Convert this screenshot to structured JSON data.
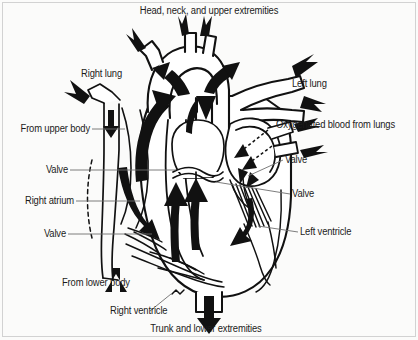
{
  "figure": {
    "background_color": "#fbfbfa",
    "ink_color": "#111111",
    "leader_color": "#6e6e6e"
  },
  "labels": {
    "top": "Head, neck, and upper extremities",
    "right_lung": "Right lung",
    "left_lung": "Left lung",
    "from_upper_body": "From upper body",
    "oxygenated_blood": "Oxygenated blood from lungs",
    "valve_left_upper": "Valve",
    "valve_right_upper": "Valve",
    "valve_right_lower": "Valve",
    "right_atrium": "Right atrium",
    "valve_left_lower": "Valve",
    "left_ventricle": "Left ventricle",
    "from_lower_body": "From lower body",
    "right_ventricle": "Right ventricle",
    "bottom": "Trunk and lower extremities"
  },
  "flow_arrows": {
    "deoxygenated": "solid black arrows through right heart",
    "oxygenated": "solid black arrows through left heart",
    "dashed": "dashed arrows in left atrium from pulmonary veins"
  }
}
